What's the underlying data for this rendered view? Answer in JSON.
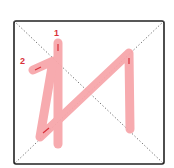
{
  "diagram": {
    "type": "stroke-order",
    "grid": {
      "border_color": "#222222",
      "guide_color": "#555555",
      "guide_style": "dotted diagonals"
    },
    "stroke_color": "#f7a7ab",
    "arrow_color": "#d9303a",
    "labels": [
      {
        "text": "1",
        "x": 54,
        "y": 29
      },
      {
        "text": "2",
        "x": 20,
        "y": 57
      }
    ]
  }
}
